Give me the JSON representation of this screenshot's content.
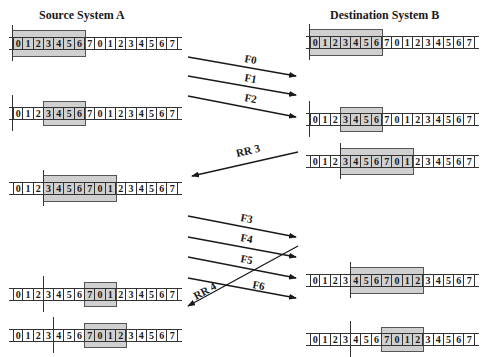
{
  "titles": {
    "source": "Source System A",
    "destination": "Destination System B"
  },
  "sequence": [
    "0",
    "1",
    "2",
    "3",
    "4",
    "5",
    "6",
    "7",
    "0",
    "1",
    "2",
    "3",
    "4",
    "5",
    "6",
    "7"
  ],
  "colors": {
    "window_fill": "#d0d0d0",
    "line": "#333333",
    "background": "#ffffff"
  },
  "source_rows": [
    {
      "label": "A1",
      "y": 37,
      "window_start": 0,
      "window_end": 6,
      "mark": 0
    },
    {
      "label": "A2",
      "y": 107,
      "window_start": 3,
      "window_end": 6,
      "mark": 0
    },
    {
      "label": "A3",
      "y": 182,
      "window_start": 3,
      "window_end": 9,
      "mark": 3
    },
    {
      "label": "A4",
      "y": 288,
      "window_start": 7,
      "window_end": 9,
      "mark": 3
    },
    {
      "label": "A5",
      "y": 329,
      "window_start": 7,
      "window_end": 10,
      "mark": 4
    }
  ],
  "destination_rows": [
    {
      "label": "B1",
      "y": 36,
      "window_start": 0,
      "window_end": 6,
      "mark": 0
    },
    {
      "label": "B2",
      "y": 113,
      "window_start": 3,
      "window_end": 6,
      "mark": 0
    },
    {
      "label": "B3",
      "y": 155,
      "window_start": 3,
      "window_end": 9,
      "mark": 3
    },
    {
      "label": "B4",
      "y": 274,
      "window_start": 4,
      "window_end": 10,
      "mark": 4
    },
    {
      "label": "B5",
      "y": 333,
      "window_start": 7,
      "window_end": 10,
      "mark": 4
    }
  ],
  "messages": [
    {
      "label": "F0",
      "direction": "A→B",
      "x1": 188,
      "y1": 57,
      "x2": 296,
      "y2": 76,
      "lx": 244,
      "ly": 62
    },
    {
      "label": "F1",
      "direction": "A→B",
      "x1": 188,
      "y1": 76,
      "x2": 296,
      "y2": 95,
      "lx": 244,
      "ly": 81
    },
    {
      "label": "F2",
      "direction": "A→B",
      "x1": 188,
      "y1": 96,
      "x2": 296,
      "y2": 117,
      "lx": 244,
      "ly": 101
    },
    {
      "label": "RR 3",
      "direction": "B→A",
      "x1": 298,
      "y1": 152,
      "x2": 192,
      "y2": 176,
      "lx": 237,
      "ly": 157
    },
    {
      "label": "F3",
      "direction": "A→B",
      "x1": 188,
      "y1": 216,
      "x2": 296,
      "y2": 237,
      "lx": 240,
      "ly": 221
    },
    {
      "label": "F4",
      "direction": "A→B",
      "x1": 188,
      "y1": 237,
      "x2": 296,
      "y2": 257,
      "lx": 240,
      "ly": 241
    },
    {
      "label": "F5",
      "direction": "A→B",
      "x1": 188,
      "y1": 257,
      "x2": 296,
      "y2": 278,
      "lx": 240,
      "ly": 262
    },
    {
      "label": "F6",
      "direction": "A→B",
      "x1": 188,
      "y1": 278,
      "x2": 296,
      "y2": 298,
      "lx": 252,
      "ly": 288
    },
    {
      "label": "RR 4",
      "direction": "B→A",
      "x1": 298,
      "y1": 246,
      "x2": 188,
      "y2": 306,
      "lx": 196,
      "ly": 300
    }
  ]
}
